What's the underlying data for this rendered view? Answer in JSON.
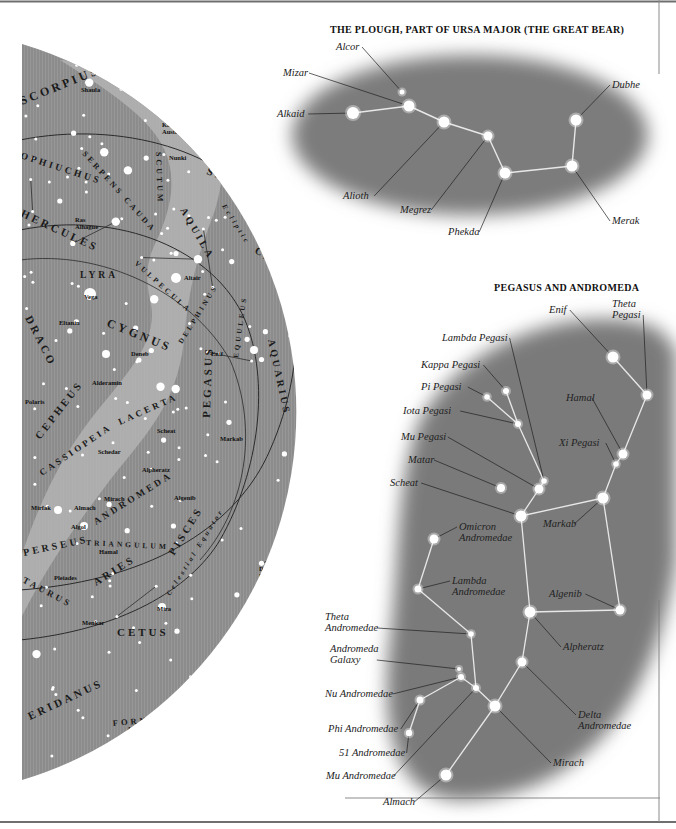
{
  "sky_map": {
    "constellations": [
      {
        "label": "SCORPIUS",
        "x": 22,
        "y": 105,
        "size": 12,
        "rotate": -22
      },
      {
        "label": "CORONA",
        "x": 196,
        "y": 112,
        "size": 7.5,
        "rotate": 25
      },
      {
        "label": "AUSTRALIS",
        "x": 180,
        "y": 118,
        "size": 7.5,
        "rotate": 30
      },
      {
        "label": "OPHIUCHUS",
        "x": 20,
        "y": 158,
        "size": 9.5,
        "rotate": 18
      },
      {
        "label": "SERPENS CAUDA",
        "x": 82,
        "y": 154,
        "size": 8,
        "rotate": 48
      },
      {
        "label": "SCUTUM",
        "x": 156,
        "y": 152,
        "size": 8,
        "rotate": 88
      },
      {
        "label": "SAGITTARIUS",
        "x": 206,
        "y": 174,
        "size": 11,
        "rotate": 20
      },
      {
        "label": "HERCULES",
        "x": 20,
        "y": 216,
        "size": 11,
        "rotate": 25
      },
      {
        "label": "AQUILA",
        "x": 180,
        "y": 210,
        "size": 10,
        "rotate": 60
      },
      {
        "label": "Ecliptic",
        "x": 222,
        "y": 206,
        "size": 7,
        "rotate": 58,
        "style": "italic"
      },
      {
        "label": "CAPRICORNUS",
        "x": 254,
        "y": 252,
        "size": 10.5,
        "rotate": 34
      },
      {
        "label": "LYRA",
        "x": 80,
        "y": 278,
        "size": 9.5,
        "rotate": 0
      },
      {
        "label": "VULPECULA",
        "x": 134,
        "y": 264,
        "size": 7.5,
        "rotate": 42
      },
      {
        "label": "DELPHINUS",
        "x": 182,
        "y": 344,
        "size": 7,
        "rotate": -58
      },
      {
        "label": "EQUULEUS",
        "x": 238,
        "y": 358,
        "size": 7,
        "rotate": -82
      },
      {
        "label": "DRACO",
        "x": 25,
        "y": 318,
        "size": 11,
        "rotate": 63
      },
      {
        "label": "CYGNUS",
        "x": 106,
        "y": 326,
        "size": 12,
        "rotate": 22
      },
      {
        "label": "AQUARIUS",
        "x": 268,
        "y": 340,
        "size": 10,
        "rotate": 78
      },
      {
        "label": "CEPHEUS",
        "x": 40,
        "y": 440,
        "size": 10.5,
        "rotate": -52
      },
      {
        "label": "LACERTA",
        "x": 120,
        "y": 425,
        "size": 9,
        "rotate": -24
      },
      {
        "label": "PEGASUS",
        "x": 210,
        "y": 418,
        "size": 11,
        "rotate": -88
      },
      {
        "label": "PISCES",
        "x": 304,
        "y": 436,
        "size": 8.5,
        "rotate": -80
      },
      {
        "label": "AUSTRINUS",
        "x": 318,
        "y": 446,
        "size": 8.5,
        "rotate": -80
      },
      {
        "label": "GRUS",
        "x": 352,
        "y": 400,
        "size": 10,
        "rotate": 88
      },
      {
        "label": "CASSIOPEIA",
        "x": 42,
        "y": 476,
        "size": 9,
        "rotate": -34
      },
      {
        "label": "ANDROMEDA",
        "x": 96,
        "y": 525,
        "size": 9.5,
        "rotate": -32
      },
      {
        "label": "SCULPTOR",
        "x": 288,
        "y": 526,
        "size": 10,
        "rotate": -55
      },
      {
        "label": "PERSEUS",
        "x": 24,
        "y": 556,
        "size": 10,
        "rotate": -12
      },
      {
        "label": "TRIANGULUM",
        "x": 86,
        "y": 545,
        "size": 7.5,
        "rotate": 3
      },
      {
        "label": "PISCES",
        "x": 174,
        "y": 556,
        "size": 10.5,
        "rotate": -58
      },
      {
        "label": "Celestial Equator",
        "x": 170,
        "y": 596,
        "size": 7,
        "rotate": -58,
        "style": "italic"
      },
      {
        "label": "ARIES",
        "x": 96,
        "y": 586,
        "size": 10.5,
        "rotate": -32
      },
      {
        "label": "TAURUS",
        "x": 22,
        "y": 582,
        "size": 9,
        "rotate": 28
      },
      {
        "label": "PHOENIX",
        "x": 262,
        "y": 640,
        "size": 10.5,
        "rotate": -60
      },
      {
        "label": "CETUS",
        "x": 117,
        "y": 636,
        "size": 11,
        "rotate": 0
      },
      {
        "label": "ERIDANUS",
        "x": 30,
        "y": 720,
        "size": 11,
        "rotate": -25
      },
      {
        "label": "FORNAX",
        "x": 113,
        "y": 726,
        "size": 8.5,
        "rotate": -5
      }
    ],
    "named_stars": [
      {
        "label": "Shaula",
        "x": 81,
        "y": 92
      },
      {
        "label": "Kaus",
        "x": 162,
        "y": 127
      },
      {
        "label": "Australis",
        "x": 162,
        "y": 134
      },
      {
        "label": "Nunki",
        "x": 169,
        "y": 160
      },
      {
        "label": "Ras",
        "x": 75,
        "y": 222
      },
      {
        "label": "Alhague",
        "x": 75,
        "y": 229
      },
      {
        "label": "Altair",
        "x": 184,
        "y": 280
      },
      {
        "label": "Vega",
        "x": 84,
        "y": 299
      },
      {
        "label": "Eltanin",
        "x": 59,
        "y": 325
      },
      {
        "label": "Deneb",
        "x": 131,
        "y": 356
      },
      {
        "label": "Enif",
        "x": 211,
        "y": 356
      },
      {
        "label": "Deneb",
        "x": 296,
        "y": 351
      },
      {
        "label": "Algedi",
        "x": 296,
        "y": 358
      },
      {
        "label": "Al",
        "x": 362,
        "y": 366
      },
      {
        "label": "Nair",
        "x": 360,
        "y": 373
      },
      {
        "label": "Alderamin",
        "x": 92,
        "y": 385
      },
      {
        "label": "Polaris",
        "x": 25,
        "y": 404
      },
      {
        "label": "Scheat",
        "x": 157,
        "y": 433
      },
      {
        "label": "Markab",
        "x": 220,
        "y": 441
      },
      {
        "label": "Fomalhaut",
        "x": 308,
        "y": 454
      },
      {
        "label": "Schedar",
        "x": 98,
        "y": 454
      },
      {
        "label": "Alpheratz",
        "x": 142,
        "y": 472
      },
      {
        "label": "Mirach",
        "x": 104,
        "y": 501
      },
      {
        "label": "Algenib",
        "x": 174,
        "y": 500
      },
      {
        "label": "Mirfak",
        "x": 31,
        "y": 510
      },
      {
        "label": "Almach",
        "x": 74,
        "y": 510
      },
      {
        "label": "Algol",
        "x": 71,
        "y": 529
      },
      {
        "label": "Hamal",
        "x": 99,
        "y": 554
      },
      {
        "label": "Pleiades",
        "x": 54,
        "y": 580
      },
      {
        "label": "Deneb",
        "x": 259,
        "y": 571
      },
      {
        "label": "Kaitos",
        "x": 259,
        "y": 578
      },
      {
        "label": "Nair Al",
        "x": 304,
        "y": 565
      },
      {
        "label": "Zaurak",
        "x": 304,
        "y": 572
      },
      {
        "label": "Mira",
        "x": 157,
        "y": 611
      },
      {
        "label": "Menkar",
        "x": 82,
        "y": 625
      },
      {
        "label": "Acamar",
        "x": 127,
        "y": 731
      }
    ]
  },
  "plough_inset": {
    "title": "THE PLOUGH, PART OF URSA MAJOR (THE GREAT BEAR)",
    "stars": [
      {
        "name": "Alcor",
        "x": 402,
        "y": 92,
        "r": 2.5,
        "label_x": 336,
        "label_y": 50
      },
      {
        "name": "Mizar",
        "x": 409,
        "y": 106,
        "r": 5.5,
        "label_x": 283,
        "label_y": 76
      },
      {
        "name": "Alkaid",
        "x": 353,
        "y": 113,
        "r": 6,
        "label_x": 277,
        "label_y": 117
      },
      {
        "name": "Alioth",
        "x": 444,
        "y": 122,
        "r": 5.5,
        "label_x": 343,
        "label_y": 199
      },
      {
        "name": "Megrez",
        "x": 488,
        "y": 136,
        "r": 4.5,
        "label_x": 400,
        "label_y": 213
      },
      {
        "name": "Phekda",
        "x": 505,
        "y": 173,
        "r": 5.5,
        "label_x": 448,
        "label_y": 235
      },
      {
        "name": "Merak",
        "x": 572,
        "y": 166,
        "r": 5.5,
        "label_x": 612,
        "label_y": 224
      },
      {
        "name": "Dubhe",
        "x": 576,
        "y": 120,
        "r": 5.5,
        "label_x": 612,
        "label_y": 88
      }
    ]
  },
  "pegasus_inset": {
    "title": "PEGASUS AND ANDROMEDA",
    "stars": [
      {
        "name": "Enif",
        "x": 613,
        "y": 357,
        "r": 5.5,
        "label_x": 549,
        "label_y": 313
      },
      {
        "name": "Theta Pegasi",
        "lines": [
          "Theta",
          "Pegasi"
        ],
        "x": 647,
        "y": 395,
        "r": 4.5,
        "label_x": 612,
        "label_y": 307
      },
      {
        "name": "Lambda Pegasi",
        "x": 544,
        "y": 481,
        "r": 2.8,
        "label_x": 442,
        "label_y": 341
      },
      {
        "name": "Kappa Pegasi",
        "x": 506,
        "y": 391,
        "r": 3,
        "label_x": 421,
        "label_y": 368
      },
      {
        "name": "Pi Pegasi",
        "x": 487,
        "y": 397,
        "r": 2.8,
        "label_x": 421,
        "label_y": 390
      },
      {
        "name": "Iota Pegasi",
        "x": 518,
        "y": 424,
        "r": 3,
        "label_x": 403,
        "label_y": 414
      },
      {
        "name": "Mu Pegasi",
        "x": 539,
        "y": 489,
        "r": 4.5,
        "label_x": 401,
        "label_y": 440
      },
      {
        "name": "Matar",
        "x": 501,
        "y": 488,
        "r": 4,
        "label_x": 408,
        "label_y": 463
      },
      {
        "name": "Scheat",
        "x": 521,
        "y": 516,
        "r": 5.5,
        "label_x": 390,
        "label_y": 486
      },
      {
        "name": "Markab",
        "x": 603,
        "y": 498,
        "r": 5.5,
        "label_x": 543,
        "label_y": 527
      },
      {
        "name": "Hamal",
        "x": 623,
        "y": 454,
        "r": 4.5,
        "label_x": 566,
        "label_y": 401
      },
      {
        "name": "Xi Pegasi",
        "x": 616,
        "y": 464,
        "r": 2.8,
        "label_x": 559,
        "label_y": 446
      },
      {
        "name": "Omicron Andromedae",
        "lines": [
          "Omicron",
          "Andromedae"
        ],
        "x": 434,
        "y": 539,
        "r": 4.5,
        "label_x": 459,
        "label_y": 530
      },
      {
        "name": "Lambda Andromedae",
        "lines": [
          "Lambda",
          "Andromedae"
        ],
        "x": 418,
        "y": 589,
        "r": 3.5,
        "label_x": 452,
        "label_y": 584
      },
      {
        "name": "Algenib",
        "x": 620,
        "y": 610,
        "r": 4.5,
        "label_x": 549,
        "label_y": 597
      },
      {
        "name": "Alpheratz",
        "x": 530,
        "y": 612,
        "r": 5.5,
        "label_x": 563,
        "label_y": 650
      },
      {
        "name": "Theta Andromedae",
        "lines": [
          "Theta",
          "Andromedae"
        ],
        "x": 471,
        "y": 634,
        "r": 2.8,
        "label_x": 325,
        "label_y": 620
      },
      {
        "name": "Andromeda Galaxy",
        "lines": [
          "Andromeda",
          "Galaxy"
        ],
        "x": 459,
        "y": 669,
        "r": 2,
        "label_x": 330,
        "label_y": 652
      },
      {
        "name": "Nu Andromedae",
        "x": 461,
        "y": 677,
        "r": 3,
        "label_x": 325,
        "label_y": 697
      },
      {
        "name": "Delta Andromedae",
        "lines": [
          "Delta",
          "Andromedae"
        ],
        "x": 522,
        "y": 662,
        "r": 4.5,
        "label_x": 578,
        "label_y": 718
      },
      {
        "name": "Phi Andromedae",
        "x": 420,
        "y": 700,
        "r": 3.5,
        "label_x": 328,
        "label_y": 732
      },
      {
        "name": "51 Andromedae",
        "x": 409,
        "y": 733,
        "r": 3.2,
        "label_x": 339,
        "label_y": 756
      },
      {
        "name": "Mu Andromedae",
        "x": 476,
        "y": 688,
        "r": 3,
        "label_x": 326,
        "label_y": 779
      },
      {
        "name": "Mirach",
        "x": 495,
        "y": 706,
        "r": 5.5,
        "label_x": 553,
        "label_y": 766
      },
      {
        "name": "Almach",
        "x": 446,
        "y": 775,
        "r": 5.5,
        "label_x": 383,
        "label_y": 805
      }
    ]
  },
  "colors": {
    "map_fill": "#8e8e8e",
    "milky_way": "#b8b8b8",
    "inset_glow": "#7a7a7a",
    "star": "#ffffff",
    "line_dark": "#2a2a2a",
    "inset_line": "#e6e6e6",
    "frame": "#6f6f6f"
  }
}
